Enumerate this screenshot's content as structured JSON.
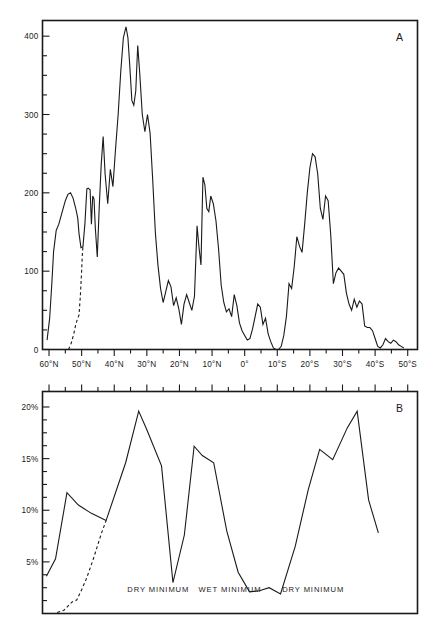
{
  "figure": {
    "background": "#ffffff",
    "ink": "#1a1a1a"
  },
  "panel_a": {
    "letter": "A",
    "y_tick_labels": [
      "0",
      "100",
      "200",
      "300",
      "400"
    ]
  },
  "panel_b": {
    "letter": "B",
    "y_tick_labels": [
      "5%",
      "10%",
      "15%",
      "20%"
    ],
    "annotations": [
      {
        "text": "DRY MINIMUM",
        "x_deg": 26.5
      },
      {
        "text": "WET MINIMUM",
        "x_deg": 4.5
      },
      {
        "text": "DRY MINIMUM",
        "x_deg": -21.0
      }
    ]
  },
  "x_axis": {
    "tick_labels": [
      "60°N",
      "50°N",
      "40°N",
      "30°N",
      "20°N",
      "10°N",
      "0°",
      "10°S",
      "20°S",
      "30°S",
      "40°S",
      "50°S"
    ],
    "tick_values": [
      60,
      50,
      40,
      30,
      20,
      10,
      0,
      -10,
      -20,
      -30,
      -40,
      -50
    ],
    "range_deg": [
      62,
      -53
    ]
  },
  "chart_data": [
    {
      "type": "line",
      "title": "A",
      "xlabel": "",
      "ylabel": "",
      "xlim": [
        62,
        -53
      ],
      "ylim": [
        0,
        420
      ],
      "grid": false,
      "legend": "none",
      "x_tick_labels": [
        "60°N",
        "50°N",
        "40°N",
        "30°N",
        "20°N",
        "10°N",
        "0°",
        "10°S",
        "20°S",
        "30°S",
        "40°S",
        "50°S"
      ],
      "y_tick_labels": [
        "0",
        "100",
        "200",
        "300",
        "400"
      ],
      "series": [
        {
          "name": "observed",
          "style": "solid",
          "x": [
            60.6,
            59.8,
            59.2,
            58.6,
            57.8,
            57.0,
            56.0,
            55.0,
            54.2,
            53.4,
            52.6,
            51.8,
            51.2,
            50.8,
            50.2,
            49.6,
            49.0,
            48.4,
            48.0,
            47.4,
            47.0,
            46.6,
            46.2,
            45.8,
            45.2,
            44.6,
            44.0,
            43.4,
            42.8,
            42.0,
            41.2,
            40.4,
            39.6,
            38.8,
            38.0,
            37.2,
            36.4,
            35.8,
            35.2,
            34.6,
            34.0,
            33.4,
            32.8,
            32.2,
            31.4,
            30.6,
            29.8,
            29.0,
            28.2,
            27.4,
            26.6,
            25.8,
            25.0,
            24.2,
            23.4,
            22.6,
            21.8,
            21.0,
            20.2,
            19.4,
            18.6,
            17.8,
            17.0,
            16.2,
            15.4,
            14.6,
            14.0,
            13.4,
            12.8,
            12.2,
            11.6,
            11.0,
            10.4,
            9.6,
            8.8,
            8.0,
            7.2,
            6.4,
            5.6,
            4.8,
            4.0,
            3.2,
            2.4,
            1.6,
            0.8,
            0.0,
            -0.8,
            -1.6,
            -2.4,
            -3.2,
            -4.0,
            -4.8,
            -5.6,
            -6.4,
            -7.2,
            -8.0,
            -8.8,
            -9.6,
            -10.4,
            -11.2,
            -12.0,
            -12.8,
            -13.6,
            -14.4,
            -15.2,
            -16.0,
            -16.8,
            -17.6,
            -18.4,
            -19.2,
            -20.0,
            -20.8,
            -21.6,
            -22.4,
            -23.2,
            -24.0,
            -24.8,
            -25.6,
            -26.4,
            -27.2,
            -28.0,
            -28.8,
            -29.6,
            -30.4,
            -31.2,
            -32.0,
            -32.8,
            -33.6,
            -34.4,
            -35.2,
            -36.0,
            -36.8,
            -37.6,
            -38.4,
            -39.2,
            -40.0,
            -40.8,
            -41.6,
            -42.4,
            -43.2,
            -44.0,
            -44.8,
            -45.6,
            -46.4,
            -47.2,
            -48.0,
            -48.8,
            -49.6,
            -50.4,
            -51.2,
            -52.0,
            -52.8
          ],
          "y": [
            12,
            40,
            80,
            125,
            152,
            160,
            175,
            190,
            198,
            200,
            193,
            180,
            168,
            148,
            130,
            131,
            160,
            205,
            206,
            204,
            160,
            196,
            192,
            155,
            118,
            182,
            236,
            272,
            224,
            186,
            230,
            208,
            256,
            300,
            355,
            398,
            412,
            398,
            360,
            318,
            312,
            330,
            388,
            354,
            300,
            278,
            300,
            276,
            216,
            150,
            108,
            78,
            60,
            74,
            88,
            80,
            56,
            66,
            52,
            32,
            58,
            70,
            60,
            50,
            68,
            158,
            130,
            108,
            220,
            210,
            180,
            176,
            196,
            186,
            164,
            128,
            82,
            60,
            48,
            52,
            42,
            70,
            56,
            34,
            24,
            18,
            12,
            14,
            26,
            42,
            58,
            54,
            32,
            40,
            20,
            10,
            2,
            0,
            0,
            4,
            18,
            42,
            84,
            78,
            106,
            144,
            132,
            124,
            160,
            200,
            232,
            250,
            246,
            224,
            180,
            166,
            196,
            190,
            146,
            84,
            98,
            104,
            100,
            96,
            72,
            58,
            50,
            64,
            54,
            62,
            58,
            30,
            28,
            28,
            24,
            14,
            4,
            2,
            6,
            14,
            10,
            8,
            12,
            10,
            6,
            4,
            2
          ]
        },
        {
          "name": "extrapolated",
          "style": "dashed",
          "x": [
            54.0,
            53.2,
            52.4,
            51.8,
            51.2,
            50.8,
            50.4,
            50.0,
            49.8,
            49.6
          ],
          "y": [
            0,
            8,
            20,
            32,
            40,
            44,
            68,
            100,
            120,
            131
          ]
        }
      ]
    },
    {
      "type": "line",
      "title": "B",
      "xlabel": "",
      "ylabel": "",
      "xlim": [
        62,
        -53
      ],
      "ylim": [
        0,
        21.5
      ],
      "grid": false,
      "legend": "none",
      "x_tick_labels": [
        "60°N",
        "50°N",
        "40°N",
        "30°N",
        "20°N",
        "10°N",
        "0°",
        "10°S",
        "20°S",
        "30°S",
        "40°S",
        "50°S"
      ],
      "y_tick_labels": [
        "5%",
        "10%",
        "15%",
        "20%"
      ],
      "series": [
        {
          "name": "observed",
          "style": "solid",
          "x": [
            60.8,
            58.0,
            54.5,
            51.0,
            47.0,
            42.5,
            36.5,
            32.5,
            30.0,
            25.5,
            22.0,
            18.5,
            15.5,
            13.0,
            9.5,
            5.5,
            2.0,
            -1.5,
            -4.5,
            -7.5,
            -11.0,
            -15.5,
            -19.5,
            -23.0,
            -27.0,
            -31.5,
            -34.5,
            -38.0,
            -41.0
          ],
          "y": [
            3.6,
            5.3,
            11.7,
            10.5,
            9.7,
            9.0,
            14.6,
            19.6,
            17.8,
            14.3,
            3.0,
            7.6,
            16.2,
            15.3,
            14.6,
            8.0,
            4.0,
            2.1,
            2.2,
            2.5,
            1.9,
            6.5,
            12.0,
            15.9,
            14.9,
            18.0,
            19.6,
            11.0,
            7.8
          ]
        },
        {
          "name": "extrapolated",
          "style": "dashed",
          "x": [
            57.5,
            55.5,
            53.0,
            51.5,
            50.0,
            48.5,
            46.5,
            44.0,
            42.5
          ],
          "y": [
            0.1,
            0.3,
            1.1,
            1.3,
            2.3,
            3.4,
            5.2,
            7.7,
            9.0
          ]
        }
      ]
    }
  ]
}
